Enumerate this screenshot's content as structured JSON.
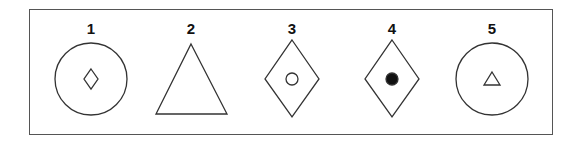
{
  "figure": {
    "items": [
      {
        "number": "1",
        "outer_shape": "circle",
        "inner_shape": "diamond",
        "inner_fill": "none"
      },
      {
        "number": "2",
        "outer_shape": "triangle",
        "inner_shape": "none",
        "inner_fill": "none"
      },
      {
        "number": "3",
        "outer_shape": "diamond",
        "inner_shape": "circle",
        "inner_fill": "none"
      },
      {
        "number": "4",
        "outer_shape": "diamond",
        "inner_shape": "circle",
        "inner_fill": "black"
      },
      {
        "number": "5",
        "outer_shape": "circle",
        "inner_shape": "triangle",
        "inner_fill": "none"
      }
    ]
  }
}
